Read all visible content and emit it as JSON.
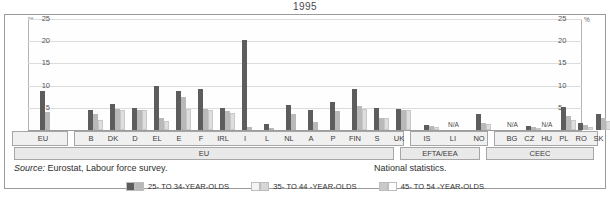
{
  "title": "1995",
  "axis": {
    "unit": "%",
    "ticks": [
      "25",
      "20",
      "15",
      "10",
      "5"
    ],
    "ymax": 25
  },
  "footnotes": {
    "source_label": "Source:",
    "source_text": " Eurostat, Labour force survey.",
    "national": "National statistics."
  },
  "legend": [
    {
      "name": "legend-25-34",
      "label": "25- TO 34-YEAR-OLDS",
      "color_dark": "#5d5d5d",
      "color_light": "#b9b9b9"
    },
    {
      "name": "legend-35-44",
      "label": "35- TO 44 -YEAR-OLDS",
      "color_dark": "#f4f4f4",
      "color_light": "#d6d6d6"
    },
    {
      "name": "legend-45-54",
      "label": "45- TO 54 -YEAR-OLDS",
      "color_dark": "#c9c9c9",
      "color_light": "#fdfdfd"
    }
  ],
  "groups": [
    {
      "label": "EU",
      "name": "group-band-eu"
    },
    {
      "label": "EFTA/EEA",
      "name": "group-band-efta"
    },
    {
      "label": "CEEC",
      "name": "group-band-ceec"
    }
  ],
  "chart_data": {
    "type": "bar",
    "title": "1995",
    "xlabel": "",
    "ylabel": "%",
    "ylim": [
      0,
      25
    ],
    "grid": true,
    "legend_position": "bottom",
    "categories": [
      "EU",
      "B",
      "DK",
      "D",
      "EL",
      "E",
      "F",
      "IRL",
      "I",
      "L",
      "NL",
      "A",
      "P",
      "FIN",
      "S",
      "UK",
      "IS",
      "LI",
      "NO",
      "BG",
      "CZ",
      "HU",
      "PL",
      "RO",
      "SK"
    ],
    "category_groups": [
      "EU",
      "EU",
      "EU",
      "EU",
      "EU",
      "EU",
      "EU",
      "EU",
      "EU",
      "EU",
      "EU",
      "EU",
      "EU",
      "EU",
      "EU",
      "EU",
      "EFTA/EEA",
      "EFTA/EEA",
      "EFTA/EEA",
      "CEEC",
      "CEEC",
      "CEEC",
      "CEEC",
      "CEEC",
      "CEEC"
    ],
    "series": [
      {
        "name": "25- TO 34-YEAR-OLDS",
        "color": "#5d5d5d",
        "values": [
          8.7,
          4.5,
          5.9,
          5.0,
          9.9,
          8.8,
          9.2,
          5.0,
          20.2,
          1.3,
          5.7,
          4.5,
          6.4,
          9.2,
          5.0,
          4.7,
          1.1,
          null,
          3.5,
          null,
          0.9,
          null,
          5.2,
          1.6,
          3.5
        ]
      },
      {
        "name": "35- TO 44 -YEAR-OLDS",
        "color": "#b9b9b9",
        "values": [
          4.0,
          3.5,
          4.7,
          4.5,
          2.6,
          7.5,
          4.8,
          4.2,
          0.6,
          0.4,
          3.6,
          1.9,
          4.3,
          5.3,
          2.8,
          4.5,
          0.9,
          null,
          1.6,
          null,
          0.6,
          null,
          3.2,
          1.2,
          2.6
        ]
      },
      {
        "name": "45- TO 54 -YEAR-OLDS",
        "color": "#dedede",
        "values": [
          0.0,
          2.3,
          4.6,
          4.4,
          2.1,
          4.7,
          4.5,
          3.9,
          0.0,
          0.0,
          0.0,
          0.0,
          0.0,
          4.8,
          2.6,
          4.6,
          0.7,
          null,
          1.4,
          null,
          0.5,
          null,
          2.2,
          0.7,
          2.1
        ]
      }
    ],
    "na_categories": [
      "LI",
      "BG",
      "HU"
    ],
    "na_label": "N/A"
  }
}
